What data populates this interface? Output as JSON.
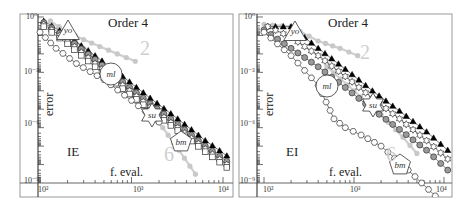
{
  "chart_data": [
    {
      "type": "line",
      "panel": "left",
      "title": "Order 4",
      "method_tag": "IE",
      "xlabel": "f. eval.",
      "ylabel": "error",
      "xscale": "log",
      "yscale": "log",
      "xlim": [
        90,
        12000
      ],
      "ylim": [
        1e-09,
        1
      ],
      "xticks": [
        "10^2",
        "10^3",
        "10^4"
      ],
      "yticks": [
        "10^0",
        "10^-3",
        "10^-6",
        "10^-9"
      ],
      "grid": false,
      "slope_reference_labels": [
        "2",
        "6"
      ],
      "annotations": [
        "yo",
        "ml",
        "su",
        "bm"
      ],
      "series": [
        {
          "name": "reference slope 2",
          "marker": "filled-circle-light",
          "color": "#cccccc",
          "x": [
            130,
            200,
            300,
            450,
            700,
            1100
          ],
          "y": [
            0.6,
            0.15,
            0.06,
            0.025,
            0.01,
            0.004
          ]
        },
        {
          "name": "reference slope 6",
          "marker": "filled-circle-light",
          "color": "#cccccc",
          "x": [
            130,
            200,
            300,
            450,
            700,
            1000,
            1500,
            2200,
            3300,
            5000
          ],
          "y": [
            0.6,
            0.12,
            0.02,
            0.003,
            0.0004,
            6e-05,
            8e-06,
            1e-06,
            6e-08,
            3e-09
          ]
        },
        {
          "name": "yo (filled triangle)",
          "marker": "filled-triangle",
          "color": "#000000",
          "x": [
            110,
            200,
            400,
            800,
            1600,
            3200,
            6400,
            11000
          ],
          "y": [
            0.6,
            0.1,
            0.008,
            0.0006,
            4e-05,
            3e-06,
            2e-07,
            3e-08
          ]
        },
        {
          "name": "ml (gray circle)",
          "marker": "gray-circle",
          "color": "#888888",
          "x": [
            110,
            200,
            400,
            800,
            1600,
            3200,
            6400,
            11000
          ],
          "y": [
            0.5,
            0.07,
            0.005,
            0.0003,
            2e-05,
            1.5e-06,
            1e-07,
            1.5e-08
          ]
        },
        {
          "name": "su (open star)",
          "marker": "open-star",
          "color": "#000000",
          "x": [
            110,
            200,
            400,
            800,
            1600,
            3200,
            6400,
            11000
          ],
          "y": [
            0.4,
            0.05,
            0.003,
            0.0002,
            1.3e-05,
            1e-06,
            7e-08,
            1e-08
          ]
        },
        {
          "name": "bm (open square)",
          "marker": "open-square",
          "color": "#000000",
          "x": [
            110,
            200,
            400,
            800,
            1600,
            3200,
            6400,
            11000
          ],
          "y": [
            0.3,
            0.035,
            0.002,
            0.00013,
            9e-06,
            7e-07,
            5e-08,
            7e-09
          ]
        },
        {
          "name": "open hexagon",
          "marker": "open-hexagon",
          "color": "#000000",
          "x": [
            100,
            150,
            250,
            500,
            1000,
            2000
          ],
          "y": [
            0.15,
            0.02,
            0.003,
            0.0004,
            3e-05,
            2e-06
          ]
        }
      ]
    },
    {
      "type": "line",
      "panel": "right",
      "title": "Order 4",
      "method_tag": "EI",
      "xlabel": "f. eval.",
      "ylabel": "error",
      "xscale": "log",
      "yscale": "log",
      "xlim": [
        90,
        12000
      ],
      "ylim": [
        1e-09,
        1
      ],
      "xticks": [
        "10^2",
        "10^3",
        "10^4"
      ],
      "yticks": [
        "10^0",
        "10^-3",
        "10^-6",
        "10^-9"
      ],
      "grid": false,
      "slope_reference_labels": [
        "2",
        "6"
      ],
      "annotations": [
        "yo",
        "ml",
        "su",
        "bm"
      ],
      "series": [
        {
          "name": "reference slope 2",
          "marker": "filled-circle-light",
          "color": "#cccccc",
          "x": [
            100,
            200,
            400,
            700,
            1100
          ],
          "y": [
            0.4,
            0.3,
            0.05,
            0.02,
            0.008
          ]
        },
        {
          "name": "reference slope 6",
          "marker": "filled-circle-light",
          "color": "#cccccc",
          "x": [
            500,
            1000,
            2000,
            3500,
            5000
          ],
          "y": [
            0.002,
            0.0001,
            5e-06,
            3e-07,
            4e-08
          ]
        },
        {
          "name": "yo (filled triangle)",
          "marker": "filled-triangle",
          "color": "#000000",
          "x": [
            110,
            200,
            400,
            800,
            1600,
            3200,
            6400,
            11000
          ],
          "y": [
            0.3,
            0.3,
            0.02,
            0.0015,
            0.0001,
            8e-06,
            6e-07,
            6e-08
          ]
        },
        {
          "name": "su (open star)",
          "marker": "open-star",
          "color": "#000000",
          "x": [
            110,
            200,
            400,
            800,
            1600,
            3200,
            6400,
            11000
          ],
          "y": [
            0.3,
            0.08,
            0.008,
            0.0006,
            4e-05,
            3e-06,
            2e-07,
            2e-08
          ]
        },
        {
          "name": "ml (gray circle)",
          "marker": "gray-circle",
          "color": "#888888",
          "x": [
            100,
            200,
            400,
            800,
            1600,
            3200,
            6400,
            11000
          ],
          "y": [
            0.2,
            0.02,
            0.002,
            0.00015,
            1e-05,
            8e-07,
            6e-08,
            5e-09
          ]
        },
        {
          "name": "bm (open hexagon)",
          "marker": "open-hexagon",
          "color": "#000000",
          "x": [
            100,
            200,
            400,
            600,
            800,
            1200,
            2000,
            4000,
            8000
          ],
          "y": [
            0.15,
            0.008,
            0.0002,
            3e-06,
            1e-06,
            4e-07,
            1e-07,
            5e-09,
            2e-10
          ]
        }
      ]
    }
  ],
  "panels": {
    "left": {
      "title": "Order 4",
      "tag": "IE",
      "xlabel": "f. eval.",
      "ylabel": "error",
      "xtick_labels": {
        "t2": "10²",
        "t3": "10³",
        "t4": "10⁴"
      },
      "ytick_labels": {
        "t0": "10⁰",
        "t3": "10⁻³",
        "t6": "10⁻⁶",
        "t9": "10⁻⁹"
      },
      "slopes": {
        "s2": "2",
        "s6": "6"
      },
      "annotations": {
        "yo": "yo",
        "ml": "ml",
        "su": "su",
        "bm": "bm"
      }
    },
    "right": {
      "title": "Order 4",
      "tag": "EI",
      "xlabel": "f. eval.",
      "ylabel": "error",
      "xtick_labels": {
        "t2": "10²",
        "t3": "10³",
        "t4": "10⁴"
      },
      "ytick_labels": {
        "t0": "10⁰",
        "t3": "10⁻³",
        "t6": "10⁻⁶",
        "t9": "10⁻⁹"
      },
      "slopes": {
        "s2": "2",
        "s6": "6"
      },
      "annotations": {
        "yo": "yo",
        "ml": "ml",
        "su": "su",
        "bm": "bm"
      }
    }
  }
}
